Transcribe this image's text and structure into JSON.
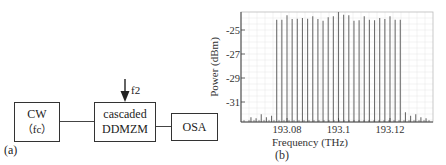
{
  "panel_a": {
    "label": "(a)",
    "blocks": {
      "cw": {
        "line1": "CW",
        "line2": "（fc）"
      },
      "modulator": {
        "line1": "cascaded",
        "line2": "DDMZM"
      },
      "osa": {
        "line1": "OSA"
      }
    },
    "rf_input_label": "f2"
  },
  "panel_b": {
    "label": "(b)"
  },
  "chart_data": {
    "type": "bar",
    "title": "",
    "xlabel": "Frequency  (THz)",
    "ylabel": "Power (dBm)",
    "xlim": [
      193.066,
      193.135
    ],
    "ylim": [
      -32.67,
      -23.5
    ],
    "xticks": [
      193.08,
      193.1,
      193.12
    ],
    "xtick_labels": [
      "193.08",
      "193.1",
      "193.12"
    ],
    "yticks": [
      -25,
      -27,
      -29,
      -31
    ],
    "ytick_labels": [
      "-25",
      "-27",
      "-29",
      "-31"
    ],
    "grid": true,
    "legend": null,
    "series": [
      {
        "name": "OFC comb lines",
        "x": [
          193.076,
          193.078,
          193.08,
          193.082,
          193.084,
          193.086,
          193.088,
          193.09,
          193.092,
          193.094,
          193.096,
          193.098,
          193.1,
          193.102,
          193.104,
          193.106,
          193.108,
          193.11,
          193.112,
          193.114,
          193.116,
          193.118,
          193.12,
          193.122,
          193.124
        ],
        "values": [
          -24.14,
          -24.14,
          -23.78,
          -24.08,
          -24.06,
          -24.0,
          -24.06,
          -23.86,
          -24.08,
          -24.23,
          -23.94,
          -23.86,
          -23.5,
          -23.73,
          -23.78,
          -24.23,
          -24.19,
          -23.86,
          -24.14,
          -24.19,
          -24.0,
          -24.08,
          -23.86,
          -24.14,
          -24.14
        ]
      },
      {
        "name": "side modes (left)",
        "x": [
          193.066,
          193.068,
          193.07,
          193.072,
          193.074
        ],
        "values": [
          -32.28,
          -32.36,
          -32.03,
          -32.28,
          -32.14
        ]
      },
      {
        "name": "side modes (right)",
        "x": [
          193.126,
          193.128,
          193.13,
          193.132,
          193.134
        ],
        "values": [
          -31.86,
          -32.14,
          -32.03,
          -32.28,
          -32.36
        ]
      }
    ]
  },
  "colors": {
    "bar": "#6e6e6e",
    "grid": "#e4e4e4",
    "frame": "#bbbbbb",
    "axis": "#444444"
  }
}
